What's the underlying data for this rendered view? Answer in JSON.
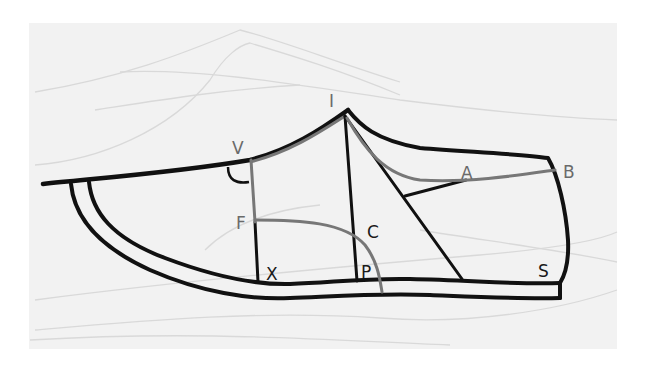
{
  "diagram": {
    "type": "shoe upper pattern (last profile)",
    "colors": {
      "page": "#ffffff",
      "paper": "#f2f2f2",
      "outline": "#111111",
      "construction_gray": "#777777",
      "faint_sketch": "#d8d8d8"
    },
    "labels": {
      "I": "I",
      "V": "V",
      "A": "A",
      "B": "B",
      "F": "F",
      "C": "C",
      "X": "X",
      "P": "P",
      "S": "S"
    }
  }
}
